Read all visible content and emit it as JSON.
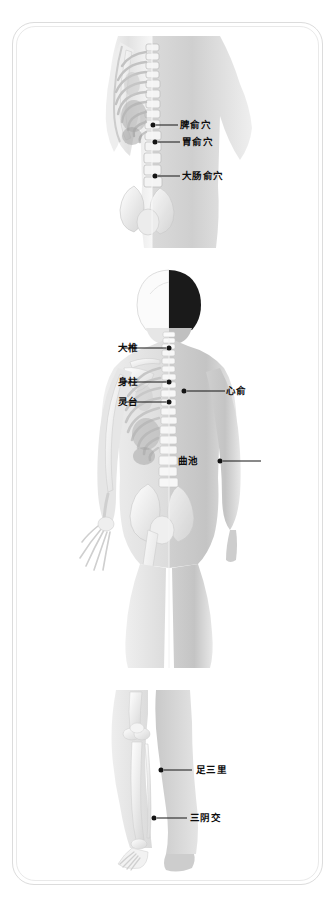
{
  "chart": {
    "title": "",
    "type": "anatomical-acupoint-diagram",
    "background_color": "#ffffff",
    "frame_color": "#dcdcdc",
    "marker_color": "#141414",
    "label_color": "#0d0d0d"
  },
  "panels": [
    {
      "id": "panel-back",
      "name": "back-torso-view",
      "description": "back-torso-skeleton-overlay",
      "points": [
        {
          "label": "脾俞穴",
          "side": "right",
          "px": 53,
          "py": 89,
          "line_len": 22,
          "label_x": 80
        },
        {
          "label": "胃俞穴",
          "side": "right",
          "px": 55,
          "py": 106,
          "line_len": 22,
          "label_x": 82
        },
        {
          "label": "大肠俞穴",
          "side": "right",
          "px": 55,
          "py": 140,
          "line_len": 22,
          "label_x": 82
        }
      ]
    },
    {
      "id": "panel-full",
      "name": "full-body-back-view",
      "description": "full-body-back-skeleton-overlay",
      "points": [
        {
          "label": "大椎",
          "side": "left",
          "px": 111,
          "py": 80,
          "line_len": 44,
          "label_x": 60
        },
        {
          "label": "身柱",
          "side": "left",
          "px": 111,
          "py": 114,
          "line_len": 44,
          "label_x": 60
        },
        {
          "label": "灵台",
          "side": "left",
          "px": 111,
          "py": 134,
          "line_len": 44,
          "label_x": 60
        },
        {
          "label": "心俞",
          "side": "right",
          "px": 126,
          "py": 123,
          "line_len": 38,
          "label_x": 168
        },
        {
          "label": "曲池",
          "side": "right",
          "px": 162,
          "py": 193,
          "line_len": 38,
          "label_x": 120
        }
      ]
    },
    {
      "id": "panel-legs",
      "name": "lower-leg-view",
      "description": "legs-skeleton-overlay",
      "points": [
        {
          "label": "足三里",
          "side": "right",
          "px": 57,
          "py": 82,
          "line_len": 28,
          "label_x": 92
        },
        {
          "label": "三阴交",
          "side": "right",
          "px": 50,
          "py": 130,
          "line_len": 30,
          "label_x": 86
        }
      ]
    }
  ]
}
